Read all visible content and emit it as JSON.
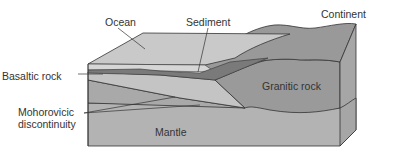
{
  "labels": {
    "ocean": "Ocean",
    "sediment": "Sediment",
    "continent": "Continent",
    "basaltic_rock": "Basaltic rock",
    "granitic_rock": "Granitic rock",
    "moho_line1": "Mohorovicic",
    "moho_line2": "discontinuity",
    "mantle": "Mantle"
  },
  "colors": {
    "ocean_top": "#c9c9c9",
    "ocean_front": "#d6d6d6",
    "sediment": "#7a7a7a",
    "basalt": "#c4c4c4",
    "granite": "#9a9a9a",
    "mantle": "#b3b3b3",
    "side": "#a6a6a6",
    "outline": "#333333"
  }
}
